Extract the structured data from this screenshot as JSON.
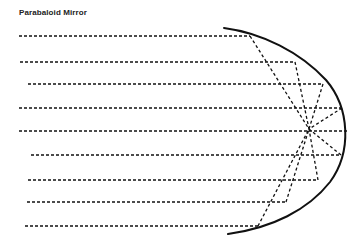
{
  "title": "Parabaloid Mirror",
  "colors": {
    "ink": "#111111",
    "background": "#ffffff"
  },
  "diagram": {
    "mirror": {
      "type": "parabola",
      "opening": "left",
      "vertex": [
        348,
        130
      ],
      "top_end": [
        224,
        28
      ],
      "bottom_end": [
        228,
        234
      ]
    },
    "focus": [
      309,
      129
    ],
    "incident_rays": [
      {
        "y": 36,
        "x_start": 19,
        "x_hit": 250
      },
      {
        "y": 62,
        "x_start": 20,
        "x_hit": 295
      },
      {
        "y": 84,
        "x_start": 28,
        "x_hit": 323
      },
      {
        "y": 108,
        "x_start": 19,
        "x_hit": 342
      },
      {
        "y": 131,
        "x_start": 19,
        "x_hit": 348
      },
      {
        "y": 155,
        "x_start": 31,
        "x_hit": 341
      },
      {
        "y": 180,
        "x_start": 28,
        "x_hit": 318
      },
      {
        "y": 202,
        "x_start": 27,
        "x_hit": 286
      },
      {
        "y": 226,
        "x_start": 25,
        "x_hit": 258
      }
    ]
  }
}
